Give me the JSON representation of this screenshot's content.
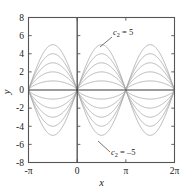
{
  "chart_data": {
    "type": "line",
    "title": "",
    "xlabel": "x",
    "ylabel": "y",
    "xlim": [
      -3.14159265,
      6.28318531
    ],
    "ylim": [
      -8,
      8
    ],
    "grid": false,
    "legend_position": "none",
    "x_tick_labels": [
      "-π",
      "0",
      "π",
      "2π"
    ],
    "x_tick_values": [
      -3.14159265,
      0,
      3.14159265,
      6.28318531
    ],
    "y_tick_labels": [
      "8",
      "6",
      "4",
      "2",
      "0",
      "-2",
      "-4",
      "-6",
      "-8"
    ],
    "y_tick_values": [
      8,
      6,
      4,
      2,
      0,
      -2,
      -4,
      -6,
      -8
    ],
    "parameter_name": "c₂",
    "parameter_values": [
      5,
      4,
      3,
      2,
      1,
      -1,
      -2,
      -3,
      -4,
      -5
    ],
    "zero_crossings": [
      -3.14159265,
      0,
      3.14159265,
      6.28318531
    ],
    "series": [
      {
        "name": "c2 = 5",
        "c2": 5,
        "peak_amplitude": 5
      },
      {
        "name": "c2 = 4",
        "c2": 4,
        "peak_amplitude": 4
      },
      {
        "name": "c2 = 3",
        "c2": 3,
        "peak_amplitude": 3
      },
      {
        "name": "c2 = 2",
        "c2": 2,
        "peak_amplitude": 2
      },
      {
        "name": "c2 = 1",
        "c2": 1,
        "peak_amplitude": 1
      },
      {
        "name": "c2 = -1",
        "c2": -1,
        "peak_amplitude": -1
      },
      {
        "name": "c2 = -2",
        "c2": -2,
        "peak_amplitude": -2
      },
      {
        "name": "c2 = -3",
        "c2": -3,
        "peak_amplitude": -3
      },
      {
        "name": "c2 = -4",
        "c2": -4,
        "peak_amplitude": -4
      },
      {
        "name": "c2 = -5",
        "c2": -5,
        "peak_amplitude": -5
      }
    ],
    "annotations": [
      {
        "id": "upper",
        "text_main": "c",
        "text_sub": "2",
        "text_rest": " = 5",
        "full_text": "c₂ = 5",
        "label_x": 6.2,
        "label_y": 0.4,
        "point_x": 4.45,
        "point_y": 1.22
      },
      {
        "id": "lower",
        "text_main": "c",
        "text_sub": "2",
        "text_rest": " = –5",
        "full_text": "c₂ = –5",
        "label_x": 6.2,
        "label_y": 0.4,
        "point_x": 4.45,
        "point_y": 1.22
      }
    ],
    "colors": {
      "curve": "#a9a9a9",
      "axis": "#3a3a3a",
      "frame": "#555555",
      "text": "#1a1a1a",
      "background": "#ffffff"
    }
  }
}
